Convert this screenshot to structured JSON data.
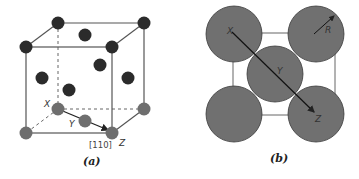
{
  "panel_a": {
    "caption": "(a)",
    "labels": {
      "x": "X",
      "y": "Y",
      "z": "Z"
    },
    "direction_label": "[110]",
    "colors": {
      "dark_atom": "#2b2b2b",
      "bottom_atom": "#6e6e6e",
      "edge": "#555555"
    }
  },
  "panel_b": {
    "caption": "(b)",
    "labels": {
      "x": "X",
      "y": "Y",
      "z": "Z",
      "radius": "R"
    },
    "colors": {
      "atom": "#707070",
      "outline": "#3a3a3a"
    }
  }
}
